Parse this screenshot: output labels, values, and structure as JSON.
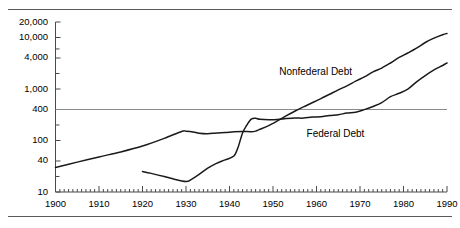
{
  "figure": {
    "top_rule": "horizontal-rule",
    "bottom_rule": "horizontal-rule"
  },
  "chart_data": {
    "type": "line",
    "title": "",
    "subtitle": "",
    "xlabel": "",
    "ylabel": "",
    "yscale": "log",
    "ylim": [
      10,
      20000
    ],
    "xlim": [
      1900,
      1990
    ],
    "grid": "single horizontal reference line at 400",
    "reference_line": 400,
    "legend_position": "inline-annotations",
    "ytick_labels": [
      "20,000",
      "10,000",
      "4,000",
      "1,000",
      "400",
      "100",
      "40",
      "10"
    ],
    "ytick_values": [
      20000,
      10000,
      4000,
      1000,
      400,
      100,
      40,
      10
    ],
    "xtick_labels": [
      "1900",
      "1910",
      "1920",
      "1930",
      "1940",
      "1950",
      "1960",
      "1970",
      "1980",
      "1990"
    ],
    "xtick_values": [
      1900,
      1910,
      1920,
      1930,
      1940,
      1950,
      1960,
      1970,
      1980,
      1990
    ],
    "minor_xticks_interval": 1,
    "series": [
      {
        "name": "Nonfederal Debt",
        "label_x": 1962,
        "label_y": 2100,
        "x": [
          1900,
          1905,
          1910,
          1915,
          1920,
          1925,
          1929,
          1930,
          1932,
          1933,
          1935,
          1937,
          1939,
          1941,
          1943,
          1945,
          1946,
          1947,
          1949,
          1951,
          1953,
          1955,
          1957,
          1959,
          1961,
          1963,
          1965,
          1967,
          1969,
          1971,
          1973,
          1975,
          1977,
          1979,
          1981,
          1983,
          1985,
          1987,
          1989,
          1990
        ],
        "values": [
          30,
          38,
          48,
          60,
          78,
          110,
          150,
          152,
          145,
          138,
          135,
          140,
          143,
          148,
          150,
          148,
          152,
          165,
          195,
          240,
          300,
          370,
          450,
          540,
          650,
          790,
          960,
          1150,
          1420,
          1720,
          2150,
          2550,
          3200,
          4100,
          5000,
          6200,
          8000,
          9700,
          11300,
          12000
        ]
      },
      {
        "name": "Federal Debt",
        "label_x": 1966,
        "label_y": 135,
        "x": [
          1920,
          1922,
          1925,
          1927,
          1930,
          1931,
          1933,
          1935,
          1937,
          1939,
          1941,
          1942,
          1943,
          1944,
          1945,
          1946,
          1947,
          1949,
          1951,
          1953,
          1955,
          1957,
          1959,
          1961,
          1963,
          1965,
          1967,
          1969,
          1971,
          1973,
          1975,
          1977,
          1979,
          1981,
          1983,
          1985,
          1987,
          1989,
          1990
        ],
        "values": [
          25,
          23,
          20,
          18,
          16,
          17,
          22,
          29,
          36,
          42,
          50,
          75,
          140,
          200,
          260,
          270,
          258,
          252,
          255,
          266,
          274,
          272,
          285,
          289,
          306,
          317,
          341,
          353,
          398,
          458,
          542,
          709,
          826,
          995,
          1377,
          1823,
          2350,
          2860,
          3200
        ]
      }
    ]
  },
  "annotations": {
    "nonfederal_label": "Nonfederal Debt",
    "federal_label": "Federal Debt"
  }
}
